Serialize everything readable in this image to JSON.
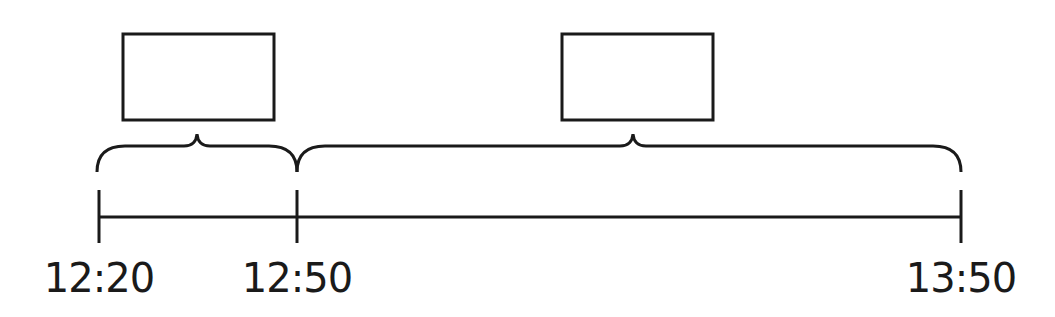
{
  "timeline": {
    "ticks": [
      {
        "label": "12:20",
        "x": 99
      },
      {
        "label": "12:50",
        "x": 297
      },
      {
        "label": "13:50",
        "x": 961
      }
    ],
    "segments": [
      {
        "from": "12:20",
        "to": "12:50",
        "box_label": ""
      },
      {
        "from": "12:50",
        "to": "13:50",
        "box_label": ""
      }
    ]
  },
  "colors": {
    "stroke": "#1a1a1a",
    "background": "#ffffff"
  }
}
